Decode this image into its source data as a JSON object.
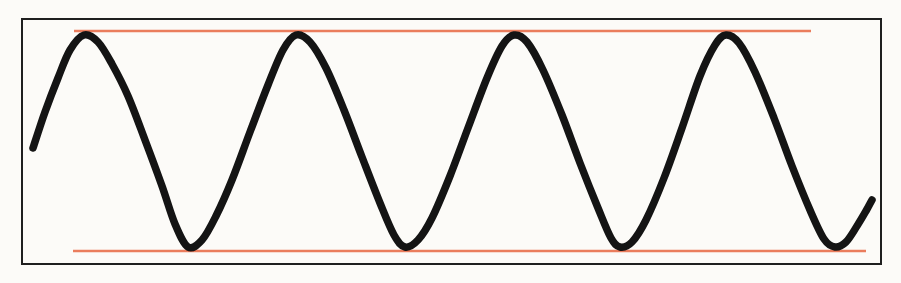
{
  "figure": {
    "title": "Sine wave with upper and lower amplitude envelope lines",
    "background_color": "#fcfbf8",
    "width": 901,
    "height": 283
  },
  "frame": {
    "name": "plot-border",
    "stroke_color": "#1f1f1f",
    "stroke_width": 2,
    "x": 21,
    "y": 18,
    "width": 861,
    "height": 247
  },
  "envelope": {
    "color": "#ea7d5d",
    "stroke_width": 2.6,
    "upper_label": "upper amplitude line",
    "lower_label": "lower amplitude line",
    "upper": {
      "y": 31,
      "x_start": 74,
      "x_end": 811
    },
    "lower": {
      "y": 251,
      "x_start": 73,
      "x_end": 866
    }
  },
  "wave": {
    "color": "#141414",
    "stroke_width": 7.5,
    "label": "sine waveform trace"
  },
  "chart_data": {
    "type": "line",
    "title": "Sine wave with upper and lower amplitude envelope lines",
    "subtitle": "",
    "xlabel": "",
    "ylabel": "",
    "grid": false,
    "legend": "none",
    "axis_ticks": "none",
    "xlim": [
      21,
      882
    ],
    "ylim": [
      18,
      265
    ],
    "y_axis_inverted": true,
    "series": [
      {
        "name": "sine-wave",
        "color": "#141414",
        "stroke_width": 7.5,
        "description": "Smooth sinusoid, 4 full crests and 4 troughs, starting mid-rise at left and ending mid-rise at right",
        "peak_y": 35,
        "trough_y": 247,
        "midline_y": 141,
        "amplitude_px": 106,
        "period_px": 214,
        "start_point": {
          "x": 33,
          "y": 148
        },
        "end_point": {
          "x": 872,
          "y": 200
        },
        "peaks_x": [
          84,
          296,
          514,
          726
        ],
        "troughs_x": [
          188,
          405,
          620,
          835
        ],
        "points": [
          {
            "x": 33,
            "y": 148
          },
          {
            "x": 45,
            "y": 112
          },
          {
            "x": 58,
            "y": 78
          },
          {
            "x": 70,
            "y": 50
          },
          {
            "x": 84,
            "y": 35
          },
          {
            "x": 98,
            "y": 42
          },
          {
            "x": 112,
            "y": 64
          },
          {
            "x": 128,
            "y": 96
          },
          {
            "x": 145,
            "y": 140
          },
          {
            "x": 162,
            "y": 186
          },
          {
            "x": 175,
            "y": 224
          },
          {
            "x": 188,
            "y": 247
          },
          {
            "x": 202,
            "y": 240
          },
          {
            "x": 216,
            "y": 216
          },
          {
            "x": 232,
            "y": 180
          },
          {
            "x": 250,
            "y": 132
          },
          {
            "x": 268,
            "y": 85
          },
          {
            "x": 283,
            "y": 50
          },
          {
            "x": 296,
            "y": 35
          },
          {
            "x": 310,
            "y": 42
          },
          {
            "x": 326,
            "y": 68
          },
          {
            "x": 344,
            "y": 110
          },
          {
            "x": 362,
            "y": 157
          },
          {
            "x": 380,
            "y": 203
          },
          {
            "x": 394,
            "y": 235
          },
          {
            "x": 405,
            "y": 247
          },
          {
            "x": 418,
            "y": 240
          },
          {
            "x": 432,
            "y": 218
          },
          {
            "x": 450,
            "y": 176
          },
          {
            "x": 468,
            "y": 128
          },
          {
            "x": 487,
            "y": 78
          },
          {
            "x": 502,
            "y": 46
          },
          {
            "x": 514,
            "y": 35
          },
          {
            "x": 527,
            "y": 42
          },
          {
            "x": 543,
            "y": 70
          },
          {
            "x": 562,
            "y": 115
          },
          {
            "x": 580,
            "y": 163
          },
          {
            "x": 598,
            "y": 208
          },
          {
            "x": 611,
            "y": 238
          },
          {
            "x": 620,
            "y": 247
          },
          {
            "x": 632,
            "y": 242
          },
          {
            "x": 646,
            "y": 220
          },
          {
            "x": 664,
            "y": 178
          },
          {
            "x": 682,
            "y": 128
          },
          {
            "x": 700,
            "y": 76
          },
          {
            "x": 715,
            "y": 45
          },
          {
            "x": 726,
            "y": 35
          },
          {
            "x": 739,
            "y": 43
          },
          {
            "x": 755,
            "y": 72
          },
          {
            "x": 774,
            "y": 118
          },
          {
            "x": 792,
            "y": 166
          },
          {
            "x": 810,
            "y": 210
          },
          {
            "x": 824,
            "y": 239
          },
          {
            "x": 835,
            "y": 247
          },
          {
            "x": 846,
            "y": 242
          },
          {
            "x": 857,
            "y": 226
          },
          {
            "x": 866,
            "y": 211
          },
          {
            "x": 872,
            "y": 200
          }
        ]
      },
      {
        "name": "upper-envelope",
        "color": "#ea7d5d",
        "stroke_width": 2.6,
        "description": "Horizontal reference line tangent to the wave crests",
        "points": [
          {
            "x": 74,
            "y": 31
          },
          {
            "x": 811,
            "y": 31
          }
        ]
      },
      {
        "name": "lower-envelope",
        "color": "#ea7d5d",
        "stroke_width": 2.6,
        "description": "Horizontal reference line tangent to the wave troughs",
        "points": [
          {
            "x": 73,
            "y": 251
          },
          {
            "x": 866,
            "y": 251
          }
        ]
      }
    ]
  }
}
